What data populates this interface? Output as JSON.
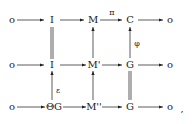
{
  "diagram": {
    "type": "commutative-diagram",
    "rows": [
      {
        "nodes": [
          "o",
          "I",
          "M",
          "C",
          "o"
        ]
      },
      {
        "nodes": [
          "o",
          "I",
          "M'",
          "G",
          "o"
        ]
      },
      {
        "nodes": [
          "o",
          "ΘG",
          "M''",
          "G",
          "o"
        ]
      }
    ],
    "horizontal_labels": {
      "row0_M_to_C": "π"
    },
    "vertical_labels": {
      "phi": "φ",
      "epsilon": "ε"
    },
    "trailing": ","
  }
}
